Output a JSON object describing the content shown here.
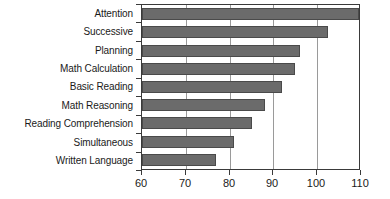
{
  "chart_data": {
    "type": "bar",
    "orientation": "horizontal",
    "title": "",
    "subtitle": "",
    "xlabel": "",
    "ylabel": "",
    "xlim": [
      60,
      110
    ],
    "ylim": null,
    "grid": true,
    "grid_axis": "x",
    "legend": null,
    "legend_position": "none",
    "categories": [
      "Attention",
      "Successive",
      "Planning",
      "Math Calculation",
      "Basic Reading",
      "Math Reasoning",
      "Reading Comprehension",
      "Simultaneous",
      "Written Language"
    ],
    "values": [
      109.5,
      102.5,
      96.0,
      95.0,
      92.0,
      88.0,
      85.0,
      81.0,
      77.0
    ],
    "xticks": [
      60,
      70,
      80,
      90,
      100,
      110
    ],
    "xtick_labels": [
      "60",
      "70",
      "80",
      "90",
      "100",
      "110"
    ],
    "bar_color": "#6b6b6b",
    "bar_edge_color": "#4a4a4a",
    "axis_color": "#3a3a3a",
    "gridline_color": "#9a9a9a",
    "background_color": "#ffffff"
  }
}
